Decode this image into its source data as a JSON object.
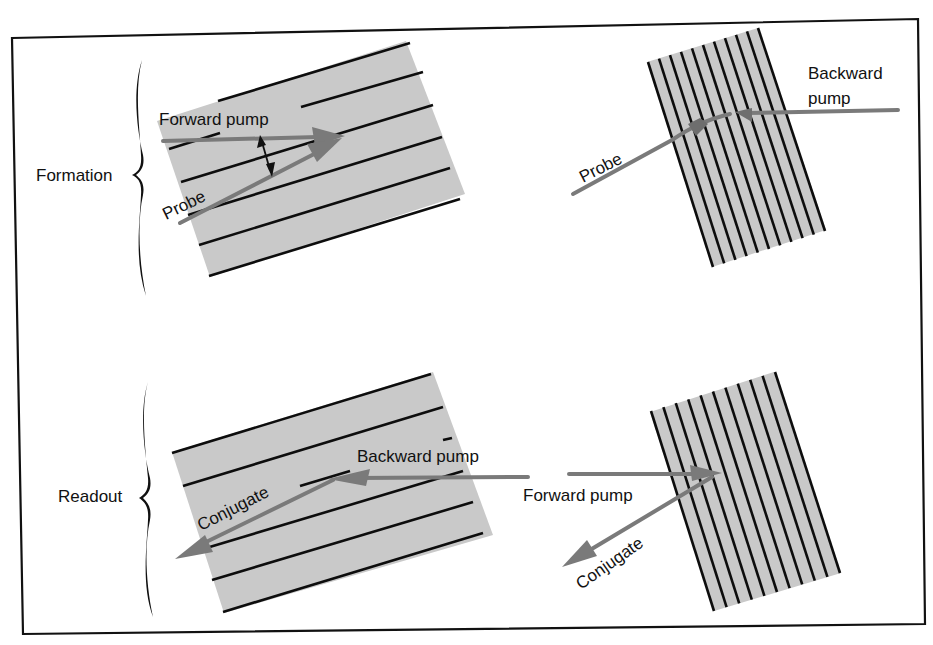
{
  "figure": {
    "colors": {
      "crystal_fill": "#c9c9c9",
      "fringe": "#0d0d0d",
      "beam": "#7a7a7a",
      "frame": "#111111"
    }
  },
  "rows": [
    {
      "id": "formation",
      "label": "Formation",
      "panels": [
        {
          "id": "formation-left",
          "grating": "transmission (fringes roughly parallel to beams)",
          "fringe_count": 6,
          "beams": [
            {
              "name": "forward-pump",
              "label": "Forward pump",
              "direction": "left-to-right"
            },
            {
              "name": "probe",
              "label": "Probe",
              "direction": "lower-left-to-upper-right"
            }
          ],
          "annotation": "double-headed arrow showing angle between forward pump and probe"
        },
        {
          "id": "formation-right",
          "grating": "reflection (fringes roughly perpendicular to beams)",
          "fringe_count": 11,
          "beams": [
            {
              "name": "probe",
              "label": "Probe",
              "direction": "lower-left-to-upper-right"
            },
            {
              "name": "backward-pump",
              "label": "Backward pump",
              "label_lines": [
                "Backward",
                "pump"
              ],
              "direction": "right-to-left"
            }
          ]
        }
      ]
    },
    {
      "id": "readout",
      "label": "Readout",
      "panels": [
        {
          "id": "readout-left",
          "grating": "transmission",
          "fringe_count": 6,
          "beams": [
            {
              "name": "backward-pump",
              "label": "Backward pump",
              "direction": "right-to-left"
            },
            {
              "name": "conjugate",
              "label": "Conjugate",
              "direction": "upper-right-to-lower-left"
            }
          ]
        },
        {
          "id": "readout-right",
          "grating": "reflection",
          "fringe_count": 11,
          "beams": [
            {
              "name": "forward-pump",
              "label": "Forward pump",
              "direction": "left-to-right"
            },
            {
              "name": "conjugate",
              "label": "Conjugate",
              "direction": "upper-right-to-lower-left"
            }
          ]
        }
      ]
    }
  ]
}
